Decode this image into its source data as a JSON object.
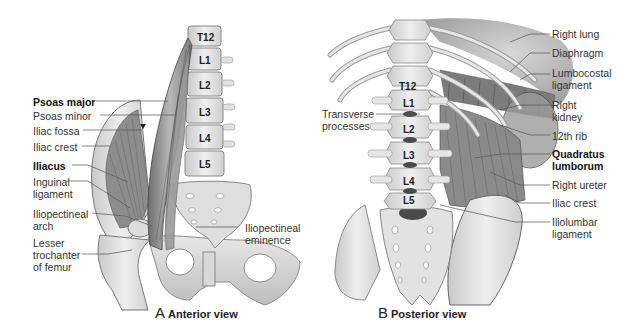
{
  "panels": [
    {
      "id": "A",
      "caption_letter": "A",
      "caption_text": "Anterior view",
      "vertebrae": [
        "T12",
        "L1",
        "L2",
        "L3",
        "L4",
        "L5"
      ],
      "labels": [
        {
          "text": "Psoas major",
          "bold": true
        },
        {
          "text": "Psoas minor",
          "bold": false
        },
        {
          "text": "Iliac fossa",
          "bold": false
        },
        {
          "text": "Iliac crest",
          "bold": false
        },
        {
          "text": "Iliacus",
          "bold": true
        },
        {
          "text": "Inguinal\nligament",
          "bold": false
        },
        {
          "text": "Iliopectineal\narch",
          "bold": false
        },
        {
          "text": "Lesser\ntrochanter\nof femur",
          "bold": false
        },
        {
          "text": "Iliopectineal\neminence",
          "bold": false
        }
      ]
    },
    {
      "id": "B",
      "caption_letter": "B",
      "caption_text": "Posterior view",
      "vertebrae": [
        "T12",
        "L1",
        "L2",
        "L3",
        "L4",
        "L5"
      ],
      "labels": [
        {
          "text": "Transverse\nprocesses",
          "bold": false
        },
        {
          "text": "Right lung",
          "bold": false
        },
        {
          "text": "Diaphragm",
          "bold": false
        },
        {
          "text": "Lumbocostal\nligament",
          "bold": false
        },
        {
          "text": "Right\nkidney",
          "bold": false
        },
        {
          "text": "12th rib",
          "bold": false
        },
        {
          "text": "Quadratus\nlumborum",
          "bold": true
        },
        {
          "text": "Right ureter",
          "bold": false
        },
        {
          "text": "Iliac crest",
          "bold": false
        },
        {
          "text": "Iliolumbar\nligament",
          "bold": false
        }
      ]
    }
  ]
}
